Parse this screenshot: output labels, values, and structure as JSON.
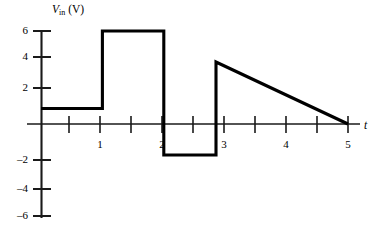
{
  "figure": {
    "background_color": "#ffffff",
    "line_color": "#000000",
    "axis_color": "#1a1a1a"
  },
  "axes": {
    "y_title_var": "V",
    "y_title_sub": "in",
    "y_title_unit": "(V)",
    "x_title": "t"
  },
  "chart_data": {
    "type": "line",
    "title": "",
    "xlabel": "t",
    "ylabel": "V_in (V)",
    "xlim": [
      0,
      5.25
    ],
    "ylim": [
      -6,
      6.6
    ],
    "grid": false,
    "legend": null,
    "x_ticks": [
      0.5,
      1,
      1.5,
      2,
      2.5,
      3,
      3.5,
      4,
      4.5,
      5
    ],
    "x_tick_labels": [
      "",
      "1",
      "",
      "2",
      "",
      "3",
      "",
      "4",
      "",
      "5"
    ],
    "y_ticks": [
      -6,
      -4,
      -2,
      0,
      2,
      4,
      6
    ],
    "y_tick_labels": [
      "–6",
      "–4",
      "–2",
      "",
      "2",
      "4",
      "6"
    ],
    "series": [
      {
        "name": "V_in",
        "description": "piecewise waveform: 1 V plateau, 6 V pulse, -2 V pulse, 4 V down-ramp to 0",
        "points": [
          [
            0.0,
            1.0
          ],
          [
            1.0,
            1.0
          ],
          [
            1.0,
            6.0
          ],
          [
            2.0,
            6.0
          ],
          [
            2.0,
            -2.0
          ],
          [
            2.85,
            -2.0
          ],
          [
            2.85,
            4.0
          ],
          [
            5.0,
            0.0
          ]
        ]
      }
    ],
    "segments": [
      {
        "label": "plateau-1v",
        "t_start": 0.0,
        "t_end": 1.0,
        "v_start": 1.0,
        "v_end": 1.0
      },
      {
        "label": "pulse-6v",
        "t_start": 1.0,
        "t_end": 2.0,
        "v_start": 6.0,
        "v_end": 6.0
      },
      {
        "label": "pulse-neg-2v",
        "t_start": 2.0,
        "t_end": 2.85,
        "v_start": -2.0,
        "v_end": -2.0
      },
      {
        "label": "ramp-down",
        "t_start": 2.85,
        "t_end": 5.0,
        "v_start": 4.0,
        "v_end": 0.0
      }
    ]
  },
  "y_tick_labels": [
    {
      "value": 6,
      "text": "6"
    },
    {
      "value": 4,
      "text": "4"
    },
    {
      "value": 2,
      "text": "2"
    },
    {
      "value": -2,
      "text": "–2"
    },
    {
      "value": -4,
      "text": "–4"
    },
    {
      "value": -6,
      "text": "–6"
    }
  ],
  "x_tick_labels": [
    {
      "value": 1,
      "text": "1"
    },
    {
      "value": 2,
      "text": "2"
    },
    {
      "value": 3,
      "text": "3"
    },
    {
      "value": 4,
      "text": "4"
    },
    {
      "value": 5,
      "text": "5"
    }
  ]
}
